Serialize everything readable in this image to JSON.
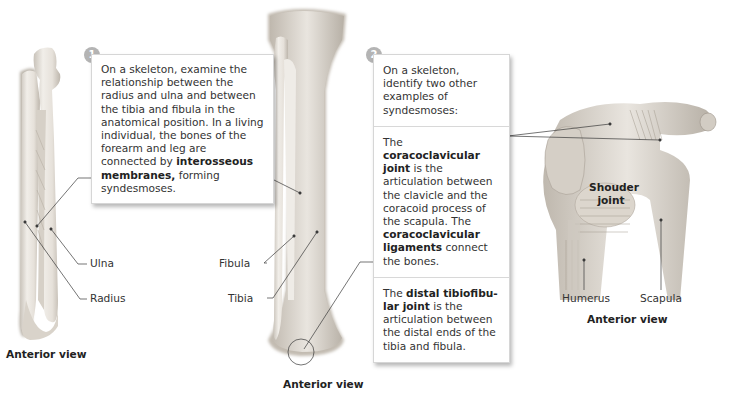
{
  "step1": {
    "number": "1",
    "text_parts": {
      "pre": "On a skeleton, examine the relationship between the radius and ulna and between the tibia and fibula in the anatomical position. In a living individual, the bones of the forearm and leg are connected by ",
      "bold": "interosseous membranes,",
      "post": " forming syndesmoses."
    }
  },
  "step2": {
    "number": "2",
    "intro": "On a skeleton, identify two other examples of syndesmoses:",
    "coracoclavicular": {
      "pre": "The ",
      "bold1": "coracoclavicular joint",
      "mid": " is the articulation between the clavicle and the coracoid process of the scapula. The ",
      "bold2": "coracoclavicular ligaments",
      "post": " connect the bones."
    },
    "tibiofibular": {
      "pre": "The ",
      "bold": "distal tibiofibu-lar joint",
      "post": " is the articulation between the distal ends of the tibia and fibula."
    }
  },
  "forearm": {
    "labels": {
      "ulna": "Ulna",
      "radius": "Radius"
    },
    "caption": "Anterior view"
  },
  "leg": {
    "labels": {
      "fibula": "Fibula",
      "tibia": "Tibia"
    },
    "caption": "Anterior view"
  },
  "shoulder": {
    "labels": {
      "joint": "Shouder joint",
      "humerus": "Humerus",
      "scapula": "Scapula"
    },
    "caption": "Anterior view"
  },
  "colors": {
    "bone_light": "#eeeae4",
    "bone_shade": "#c9c3ba",
    "leader_line": "#3a3a3a",
    "step_badge": "#b4b4b4"
  }
}
